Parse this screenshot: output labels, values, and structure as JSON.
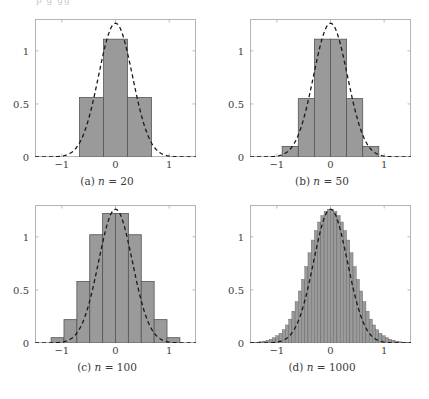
{
  "top_clipped_text": "p        g       gg",
  "figure": {
    "style": "2x2 grid of histograms with normal density overlay",
    "bar_fill_color": "#9a9a9a",
    "bar_edge_color": "#555555",
    "curve_color": "#1a1a1a",
    "frame_color": "#b4b4b4",
    "background_color": "#ffffff",
    "panels": [
      {
        "caption": "(a) n = 20",
        "key": "a"
      },
      {
        "caption": "(b) n = 50",
        "key": "b"
      },
      {
        "caption": "(c) n = 100",
        "key": "c"
      },
      {
        "caption": "(d) n = 1000",
        "key": "d"
      }
    ]
  },
  "chart_data": [
    {
      "type": "bar",
      "title": "(a) n = 20",
      "xlabel": "",
      "ylabel": "",
      "xlim": [
        -1.5,
        1.5
      ],
      "ylim": [
        0,
        1.3
      ],
      "xticks": [
        -1,
        0,
        1
      ],
      "xticklabels": [
        "−1",
        "0",
        "1"
      ],
      "yticks": [
        0,
        0.5,
        1
      ],
      "yticklabels": [
        "0",
        "0.5",
        "1"
      ],
      "grid": false,
      "legend": null,
      "bin_edges": [
        -0.67,
        -0.223,
        0.223,
        0.67
      ],
      "values": [
        0.56,
        1.11,
        0.56
      ],
      "overlay": {
        "type": "line",
        "style": "dashed",
        "name": "normal density",
        "mean": 0,
        "sigma": 0.316,
        "peak": 1.26
      }
    },
    {
      "type": "bar",
      "title": "(b) n = 50",
      "xlabel": "",
      "ylabel": "",
      "xlim": [
        -1.5,
        1.5
      ],
      "ylim": [
        0,
        1.3
      ],
      "xticks": [
        -1,
        0,
        1
      ],
      "xticklabels": [
        "−1",
        "0",
        "1"
      ],
      "yticks": [
        0,
        0.5,
        1
      ],
      "yticklabels": [
        "0",
        "0.5",
        "1"
      ],
      "grid": false,
      "legend": null,
      "bin_edges": [
        -0.9,
        -0.6,
        -0.3,
        0.0,
        0.3,
        0.6,
        0.9
      ],
      "values": [
        0.1,
        0.55,
        1.11,
        1.11,
        0.55,
        0.1
      ],
      "overlay": {
        "type": "line",
        "style": "dashed",
        "name": "normal density",
        "mean": 0,
        "sigma": 0.316,
        "peak": 1.26
      }
    },
    {
      "type": "bar",
      "title": "(c) n = 100",
      "xlabel": "",
      "ylabel": "",
      "xlim": [
        -1.5,
        1.5
      ],
      "ylim": [
        0,
        1.3
      ],
      "xticks": [
        -1,
        0,
        1
      ],
      "xticklabels": [
        "−1",
        "0",
        "1"
      ],
      "yticks": [
        0,
        0.5,
        1
      ],
      "yticklabels": [
        "0",
        "0.5",
        "1"
      ],
      "grid": false,
      "legend": null,
      "bin_edges": [
        -0.96,
        -0.72,
        -0.48,
        -0.24,
        0.0,
        0.24,
        0.48,
        0.72,
        0.96
      ],
      "values": [
        0.05,
        0.22,
        0.58,
        1.02,
        1.22,
        1.22,
        1.02,
        0.58,
        0.22,
        0.05
      ],
      "overlay": {
        "type": "line",
        "style": "dashed",
        "name": "normal density",
        "mean": 0,
        "sigma": 0.316,
        "peak": 1.26
      }
    },
    {
      "type": "bar",
      "title": "(d) n = 1000",
      "xlabel": "",
      "ylabel": "",
      "xlim": [
        -1.5,
        1.5
      ],
      "ylim": [
        0,
        1.3
      ],
      "xticks": [
        -1,
        0,
        1
      ],
      "xticklabels": [
        "−1",
        "0",
        "1"
      ],
      "yticks": [
        0,
        0.5,
        1
      ],
      "yticklabels": [
        "0",
        "0.5",
        "1"
      ],
      "grid": false,
      "legend": null,
      "n_bins": 50,
      "bin_width": 0.06,
      "bin_start": -1.5,
      "values": [
        0.004,
        0.006,
        0.008,
        0.012,
        0.018,
        0.026,
        0.036,
        0.05,
        0.068,
        0.092,
        0.125,
        0.17,
        0.225,
        0.3,
        0.39,
        0.49,
        0.6,
        0.72,
        0.85,
        0.97,
        1.06,
        1.14,
        1.2,
        1.24,
        1.26,
        1.26,
        1.24,
        1.2,
        1.14,
        1.06,
        0.97,
        0.85,
        0.72,
        0.6,
        0.49,
        0.39,
        0.3,
        0.225,
        0.17,
        0.125,
        0.092,
        0.068,
        0.05,
        0.036,
        0.026,
        0.018,
        0.012,
        0.008,
        0.006,
        0.004
      ],
      "overlay": {
        "type": "line",
        "style": "dashed",
        "name": "normal density",
        "mean": 0,
        "sigma": 0.316,
        "peak": 1.26
      }
    }
  ]
}
